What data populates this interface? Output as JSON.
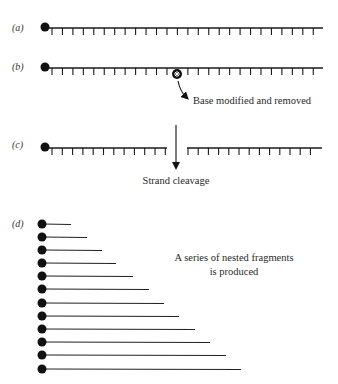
{
  "figure": {
    "panels": [
      {
        "id": "a",
        "label": "(a)",
        "description": "Intact end-labeled DNA strand",
        "strand": {
          "y": 28,
          "x_start": 45,
          "x_end": 323,
          "tick_start": 52,
          "tick_spacing": 10.45,
          "tick_count": 26
        }
      },
      {
        "id": "b",
        "label": "(b)",
        "description": "Base modification",
        "strand": {
          "y": 68,
          "x_start": 45,
          "x_end": 323,
          "tick_start": 52,
          "tick_spacing": 10.45,
          "tick_count": 26,
          "skip_tick_index": 12
        },
        "modified_base": {
          "x": 177,
          "y": 74,
          "r": 4.5
        },
        "annotation": "Base modified and removed"
      },
      {
        "id": "c",
        "label": "(c)",
        "description": "Strand cleavage",
        "left_segment": {
          "y": 148,
          "x_start": 45,
          "x_end": 167,
          "tick_start": 52,
          "tick_spacing": 10.3,
          "tick_count": 12
        },
        "right_segment": {
          "y": 148,
          "x_start": 187,
          "x_end": 322,
          "tick_start": 188,
          "tick_spacing": 10.2,
          "tick_count": 13
        },
        "cleavage_arrow": {
          "x": 176,
          "y_start": 125,
          "y_end": 172
        },
        "annotation": "Strand cleavage"
      },
      {
        "id": "d",
        "label": "(d)",
        "description": "Nested fragments",
        "fragments": [
          {
            "y": 224,
            "x_end": 71
          },
          {
            "y": 237,
            "x_end": 87
          },
          {
            "y": 250,
            "x_end": 102
          },
          {
            "y": 263,
            "x_end": 116
          },
          {
            "y": 276,
            "x_end": 133
          },
          {
            "y": 289,
            "x_end": 149
          },
          {
            "y": 303,
            "x_end": 164
          },
          {
            "y": 316,
            "x_end": 179
          },
          {
            "y": 329,
            "x_end": 195
          },
          {
            "y": 342,
            "x_end": 210
          },
          {
            "y": 355,
            "x_end": 226
          },
          {
            "y": 369,
            "x_end": 241
          }
        ],
        "annotation_line1": "A series of nested fragments",
        "annotation_line2": "is produced"
      }
    ],
    "colors": {
      "ink": "#1a1a1a",
      "background": "#ffffff"
    }
  }
}
